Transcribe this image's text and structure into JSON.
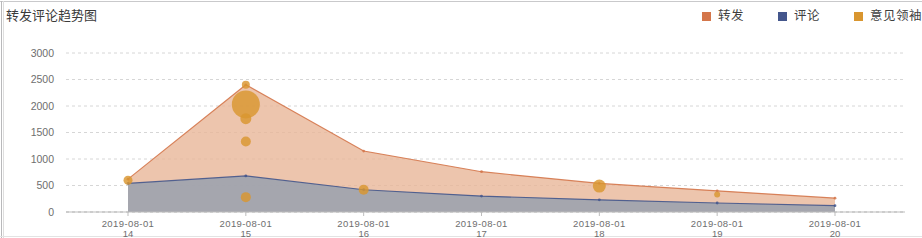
{
  "panel": {
    "title": "转发评论趋势图",
    "background_color": "#ffffff"
  },
  "legend": {
    "position": "top-right",
    "items": [
      {
        "label": "转发",
        "color": "#d4764a"
      },
      {
        "label": "评论",
        "color": "#44568c"
      },
      {
        "label": "意见领袖",
        "color": "#d9962f"
      }
    ]
  },
  "chart_data": {
    "type": "area",
    "title": "转发评论趋势图",
    "xlabel": "",
    "ylabel": "",
    "grid": true,
    "legend_position": "top-right",
    "categories": [
      "2019-08-01 14",
      "2019-08-01 15",
      "2019-08-01 16",
      "2019-08-01 17",
      "2019-08-01 18",
      "2019-08-01 19",
      "2019-08-01 20"
    ],
    "x_tick_labels": [
      {
        "line1": "2019-08-01",
        "line2": "14"
      },
      {
        "line1": "2019-08-01",
        "line2": "15"
      },
      {
        "line1": "2019-08-01",
        "line2": "16"
      },
      {
        "line1": "2019-08-01",
        "line2": "17"
      },
      {
        "line1": "2019-08-01",
        "line2": "18"
      },
      {
        "line1": "2019-08-01",
        "line2": "19"
      },
      {
        "line1": "2019-08-01",
        "line2": "20"
      }
    ],
    "y_tick_labels": [
      "0",
      "500",
      "1000",
      "1500",
      "2000",
      "2500",
      "3000"
    ],
    "y_tick_values": [
      0,
      500,
      1000,
      1500,
      2000,
      2500,
      3000
    ],
    "ylim": [
      0,
      3000
    ],
    "series": [
      {
        "name": "转发",
        "type": "area",
        "color": "#d4764a",
        "fill_color": "#e8b698",
        "values": [
          620,
          2400,
          1150,
          760,
          540,
          400,
          260
        ]
      },
      {
        "name": "评论",
        "type": "area",
        "color": "#44568c",
        "fill_color": "#9ea3ae",
        "values": [
          540,
          680,
          420,
          300,
          230,
          170,
          120
        ]
      },
      {
        "name": "意见领袖",
        "type": "bubble",
        "color": "#d9962f",
        "points": [
          {
            "x": 0,
            "y": 600,
            "size": 9
          },
          {
            "x": 1,
            "y": 2400,
            "size": 8
          },
          {
            "x": 1,
            "y": 2030,
            "size": 28
          },
          {
            "x": 1,
            "y": 1760,
            "size": 11
          },
          {
            "x": 1,
            "y": 1330,
            "size": 10
          },
          {
            "x": 1,
            "y": 280,
            "size": 10
          },
          {
            "x": 2,
            "y": 420,
            "size": 10
          },
          {
            "x": 4,
            "y": 490,
            "size": 13
          },
          {
            "x": 5,
            "y": 330,
            "size": 6
          }
        ]
      }
    ]
  }
}
